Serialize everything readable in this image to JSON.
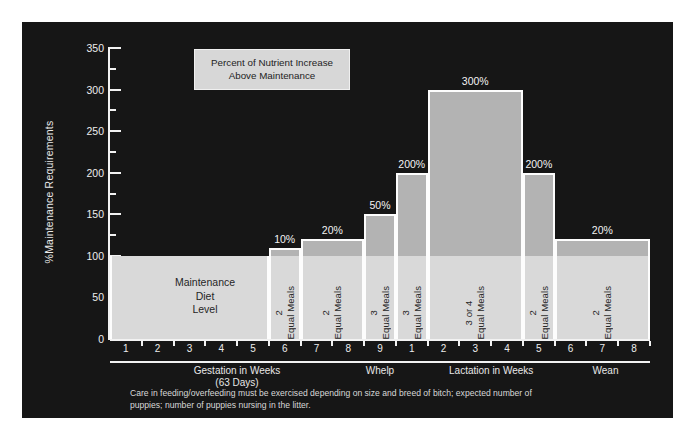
{
  "chart_data": {
    "type": "bar",
    "title": "Percent of Nutrient Increase Above Maintenance",
    "ylabel": "%Maintenance Requirements",
    "ylim": [
      0,
      350
    ],
    "ytick_labels": [
      "0",
      "50",
      "100",
      "150",
      "200",
      "250",
      "300",
      "350"
    ],
    "ytick_values": [
      0,
      50,
      100,
      150,
      200,
      250,
      300,
      350
    ],
    "minor_tick_step": 25,
    "grid": false,
    "baseline_value": 100,
    "baseline_label": "Maintenance\nDiet\nLevel",
    "xlabel": "",
    "x_tick_labels": [
      "1",
      "2",
      "3",
      "4",
      "5",
      "6",
      "7",
      "8",
      "9",
      "1",
      "2",
      "3",
      "4",
      "5",
      "6",
      "7",
      "8"
    ],
    "x_sections": [
      {
        "label": "Gestation in Weeks\n(63 Days)",
        "center_index": 4.0
      },
      {
        "label": "Whelp",
        "center_index": 8.5
      },
      {
        "label": "Lactation in Weeks",
        "center_index": 12.0
      },
      {
        "label": "Wean",
        "center_index": 15.6
      }
    ],
    "series": [
      {
        "name": "Maintenance Diet Level",
        "start_index": 0,
        "end_index": 5,
        "value": 100,
        "label": "",
        "meals": ""
      },
      {
        "name": "10% increase",
        "start_index": 5,
        "end_index": 6,
        "value": 110,
        "label": "10%",
        "meals": "2\nEqual Meals"
      },
      {
        "name": "20% increase",
        "start_index": 6,
        "end_index": 8,
        "value": 120,
        "label": "20%",
        "meals": "2\nEqual Meals"
      },
      {
        "name": "50% increase",
        "start_index": 8,
        "end_index": 9,
        "value": 150,
        "label": "50%",
        "meals": "3\nEqual Meals"
      },
      {
        "name": "200% increase pre-lactation",
        "start_index": 9,
        "end_index": 10,
        "value": 200,
        "label": "200%",
        "meals": "3\nEqual Meals"
      },
      {
        "name": "300% peak lactation",
        "start_index": 10,
        "end_index": 13,
        "value": 300,
        "label": "300%",
        "meals": "3 or 4\nEqual Meals"
      },
      {
        "name": "200% decline",
        "start_index": 13,
        "end_index": 14,
        "value": 200,
        "label": "200%",
        "meals": "2\nEqual Meals"
      },
      {
        "name": "20% wean",
        "start_index": 14,
        "end_index": 17,
        "value": 120,
        "label": "20%",
        "meals": "2\nEqual Meals"
      }
    ]
  },
  "legend": {
    "line1": "Percent of Nutrient Increase",
    "line2": "Above Maintenance"
  },
  "baseline": {
    "line1": "Maintenance",
    "line2": "Diet",
    "line3": "Level"
  },
  "caption": {
    "text": "Care in feeding/overfeeding must be exercised depending on size and breed of bitch; expected number of puppies; number of puppies nursing in the litter."
  },
  "axis": {
    "y_title": "%Maintenance Requirements"
  }
}
